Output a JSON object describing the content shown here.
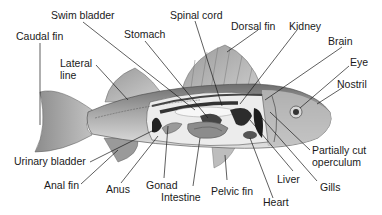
{
  "diagram": {
    "labels": {
      "caudal_fin": "Caudal fin",
      "swim_bladder": "Swim bladder",
      "spinal_cord": "Spinal cord",
      "stomach": "Stomach",
      "dorsal_fin": "Dorsal fin",
      "kidney": "Kidney",
      "brain": "Brain",
      "lateral_line_1": "Lateral",
      "lateral_line_2": "line",
      "eye": "Eye",
      "nostril": "Nostril",
      "partially_cut_operculum_1": "Partially cut",
      "partially_cut_operculum_2": "operculum",
      "urinary_bladder": "Urinary bladder",
      "gills": "Gills",
      "liver": "Liver",
      "anal_fin": "Anal fin",
      "anus": "Anus",
      "gonad": "Gonad",
      "intestine": "Intestine",
      "pelvic_fin": "Pelvic fin",
      "heart": "Heart"
    },
    "colors": {
      "background": "#ffffff",
      "body": "#8a8a8a",
      "body_light": "#d9d9d9",
      "organ_dark": "#3a3a3a",
      "leader_line": "#1a1a1a"
    }
  }
}
